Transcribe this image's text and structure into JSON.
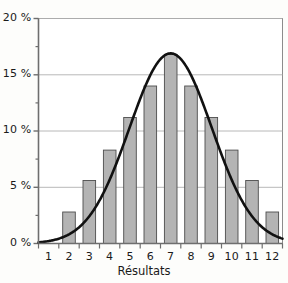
{
  "chart_data": {
    "type": "bar",
    "title": "",
    "subtitle": "",
    "xlabel": "Résultats",
    "ylabel": "",
    "categories": [
      "1",
      "2",
      "3",
      "4",
      "5",
      "6",
      "7",
      "8",
      "9",
      "10",
      "11",
      "12"
    ],
    "values": [
      0,
      2.8,
      5.6,
      8.3,
      11.2,
      14.0,
      16.8,
      14.0,
      11.2,
      8.3,
      5.6,
      2.8
    ],
    "series": [
      {
        "name": "Fréquence",
        "type": "bar",
        "values": [
          0,
          2.8,
          5.6,
          8.3,
          11.2,
          14.0,
          16.8,
          14.0,
          11.2,
          8.3,
          5.6,
          2.8
        ]
      },
      {
        "name": "Courbe normale",
        "type": "line",
        "x": [
          0.5,
          1,
          2,
          3,
          4,
          5,
          6,
          7,
          8,
          9,
          10,
          11,
          12,
          12.5
        ],
        "values": [
          0.15,
          0.3,
          1.1,
          3.0,
          6.6,
          11.6,
          15.8,
          16.9,
          15.8,
          11.6,
          6.6,
          3.0,
          1.1,
          0.5
        ]
      }
    ],
    "ylim": [
      0,
      20
    ],
    "yticks": [
      0,
      5,
      10,
      15,
      20
    ],
    "ytick_labels": [
      "0 %",
      "5 %",
      "10 %",
      "15 %",
      "20 %"
    ],
    "yminor_ticks": [
      2.5,
      7.5,
      12.5,
      17.5
    ],
    "xticks": [
      "1",
      "2",
      "3",
      "4",
      "5",
      "6",
      "7",
      "8",
      "9",
      "10",
      "11",
      "12"
    ],
    "grid": true,
    "grid_axis": "y",
    "legend": false,
    "legend_position": "none"
  },
  "style": {
    "bar_fill": "#b4b4b4",
    "bar_stroke": "#4d4d4d",
    "curve_color": "#111111",
    "grid_color": "#b0b0b0",
    "axis_color": "#6e6e6e",
    "text_color": "#1a1a1a",
    "background": "#fdfdfb"
  }
}
